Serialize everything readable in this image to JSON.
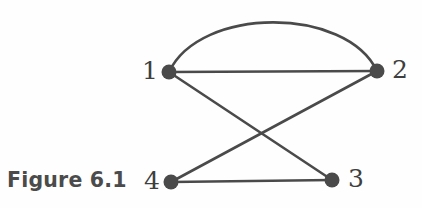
{
  "figure": {
    "caption": "Figure 6.1",
    "background_color": "#fefefe",
    "ink_color": "#4a4a4a",
    "label_color": "#3f3f3f"
  },
  "graph": {
    "type": "undirected-multigraph",
    "nodes": [
      {
        "id": "1",
        "label": "1",
        "cx": 169,
        "cy": 72,
        "r": 7.5,
        "label_x": 142,
        "label_y": 58
      },
      {
        "id": "2",
        "label": "2",
        "cx": 377,
        "cy": 71,
        "r": 7.5,
        "label_x": 392,
        "label_y": 57
      },
      {
        "id": "3",
        "label": "3",
        "cx": 332,
        "cy": 180,
        "r": 7.5,
        "label_x": 348,
        "label_y": 166
      },
      {
        "id": "4",
        "label": "4",
        "cx": 171,
        "cy": 182,
        "r": 7.5,
        "label_x": 144,
        "label_y": 168
      }
    ],
    "edges": [
      {
        "id": "e-1-2-arc",
        "from": "1",
        "to": "2",
        "shape": "curved",
        "apex_y": 13
      },
      {
        "id": "e-1-2-straight",
        "from": "1",
        "to": "2",
        "shape": "straight"
      },
      {
        "id": "e-1-3",
        "from": "1",
        "to": "3",
        "shape": "straight"
      },
      {
        "id": "e-2-4",
        "from": "2",
        "to": "4",
        "shape": "straight"
      },
      {
        "id": "e-4-3",
        "from": "4",
        "to": "3",
        "shape": "straight"
      }
    ],
    "edge_paths": {
      "arc_1_2": "M 169 72 C 200 6, 346 6, 377 71",
      "line_1_2": "M 169 72 L 377 71",
      "line_1_3": "M 169 72 L 332 180",
      "line_2_4": "M 377 71 L 171 182",
      "line_4_3": "M 171 182 L 332 180"
    },
    "stroke_width": 2.6
  }
}
